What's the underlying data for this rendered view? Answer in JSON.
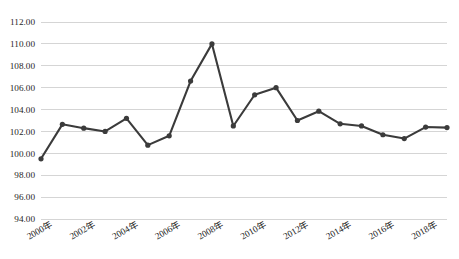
{
  "chart_data": {
    "type": "line",
    "title": "",
    "subtitle": "",
    "xlabel": "",
    "ylabel": "",
    "grid": true,
    "legend": "none",
    "ylim": [
      94.0,
      112.0
    ],
    "ytick_step": 2.0,
    "ytick_labels": [
      "112.00",
      "110.00",
      "108.00",
      "106.00",
      "104.00",
      "102.00",
      "100.00",
      "98.00",
      "96.00",
      "94.00"
    ],
    "ytick_values": [
      112.0,
      110.0,
      108.0,
      106.0,
      104.0,
      102.0,
      100.0,
      98.0,
      96.0,
      94.0
    ],
    "xtick_labels": [
      "2000年",
      "2002年",
      "2004年",
      "2006年",
      "2008年",
      "2010年",
      "2012年",
      "2014年",
      "2016年",
      "2018年"
    ],
    "xtick_values": [
      2000,
      2002,
      2004,
      2006,
      2008,
      2010,
      2012,
      2014,
      2016,
      2018
    ],
    "xtick_rotation_deg": -30,
    "x": [
      2000,
      2001,
      2002,
      2003,
      2004,
      2005,
      2006,
      2007,
      2008,
      2009,
      2010,
      2011,
      2012,
      2013,
      2014,
      2015,
      2016,
      2017,
      2018,
      2019
    ],
    "categories": [
      "2000年",
      "2001年",
      "2002年",
      "2003年",
      "2004年",
      "2005年",
      "2006年",
      "2007年",
      "2008年",
      "2009年",
      "2010年",
      "2011年",
      "2012年",
      "2013年",
      "2014年",
      "2015年",
      "2016年",
      "2017年",
      "2018年",
      "2019年"
    ],
    "values": [
      99.5,
      102.65,
      102.3,
      102.0,
      103.2,
      100.75,
      101.6,
      106.6,
      110.0,
      102.5,
      105.35,
      106.0,
      103.0,
      103.85,
      102.7,
      102.5,
      101.7,
      101.35,
      102.4,
      102.35
    ],
    "series": [
      {
        "name": "",
        "values": [
          99.5,
          102.65,
          102.3,
          102.0,
          103.2,
          100.75,
          101.6,
          106.6,
          110.0,
          102.5,
          105.35,
          106.0,
          103.0,
          103.85,
          102.7,
          102.5,
          101.7,
          101.35,
          102.4,
          102.35
        ]
      }
    ],
    "colors": {
      "line": "#3b3b3b",
      "marker": "#3b3b3b",
      "gridline": "#d0d0d0",
      "text": "#262626",
      "background": "#ffffff"
    },
    "marker_style": "circle",
    "annotations": []
  }
}
